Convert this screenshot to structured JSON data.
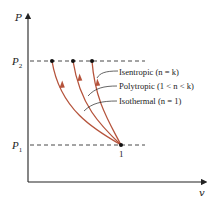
{
  "diagram": {
    "type": "P-v process diagram",
    "axes": {
      "y_label": "P",
      "x_label": "v"
    },
    "pressure_levels": [
      {
        "name": "P2",
        "symbol": "P",
        "subscript": "2"
      },
      {
        "name": "P1",
        "symbol": "P",
        "subscript": "1"
      }
    ],
    "state_point_label": "1",
    "processes": [
      {
        "name": "Isentropic",
        "label": "Isentropic (n = k)"
      },
      {
        "name": "Polytropic",
        "label": "Polytropic (1 < n < k)"
      },
      {
        "name": "Isothermal",
        "label": "Isothermal (n = 1)"
      }
    ],
    "colors": {
      "curve": "#b5533b",
      "axis": "#222222",
      "dashed": "#333333"
    }
  }
}
